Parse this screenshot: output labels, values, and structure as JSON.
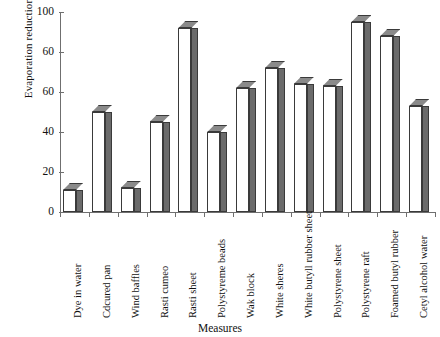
{
  "chart_data": {
    "type": "bar",
    "title": "",
    "xlabel": "Measures",
    "ylabel": "Evaporation reduction %",
    "ylim": [
      0,
      100
    ],
    "ytick_labels": [
      "100",
      "60",
      "60",
      "40",
      "20",
      "0"
    ],
    "ytick_values": [
      100,
      80,
      60,
      40,
      20,
      0
    ],
    "grid": false,
    "legend": "none",
    "categories": [
      "Dye in water",
      "Cdcured pan",
      "Wind baffles",
      "Rasti cumeo",
      "Rasti sheet",
      "Polystyreme beads",
      "Wak block",
      "White sheres",
      "White butyll rubber sheet",
      "Polystyrene sheet",
      "Polystyrene raft",
      "Foamed butyl rubber",
      "Cetyl alcohol water"
    ],
    "values": [
      11,
      50,
      12,
      45,
      92,
      40,
      62,
      72,
      64,
      63,
      95,
      88,
      53
    ],
    "colors": {
      "bar_front": "#ffffff",
      "bar_side": "#6b6b6b",
      "bar_top": "#8a8a8a",
      "bar_outline": "#3a3a3a",
      "axis": "#6f6f6f",
      "text": "#111111"
    }
  }
}
